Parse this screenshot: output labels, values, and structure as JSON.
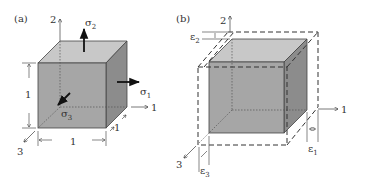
{
  "figure": {
    "panels": [
      {
        "id": "a",
        "label": "(a)",
        "axes": {
          "x": "1",
          "y": "2",
          "z": "3"
        },
        "stresses": {
          "s1": "σ",
          "s1_sub": "1",
          "s2": "σ",
          "s2_sub": "2",
          "s3": "σ",
          "s3_sub": "3"
        },
        "dimensions": {
          "height": "1",
          "width": "1",
          "depth": "1"
        }
      },
      {
        "id": "b",
        "label": "(b)",
        "axes": {
          "x": "1",
          "y": "2",
          "z": "3"
        },
        "strains": {
          "e1": "ε",
          "e1_sub": "1",
          "e2": "ε",
          "e2_sub": "2",
          "e3": "ε",
          "e3_sub": "3"
        }
      }
    ],
    "colors": {
      "front_face": "#a6a6a6",
      "top_face": "#c8c8c8",
      "side_face": "#8c8c8c",
      "line": "#333333"
    }
  }
}
